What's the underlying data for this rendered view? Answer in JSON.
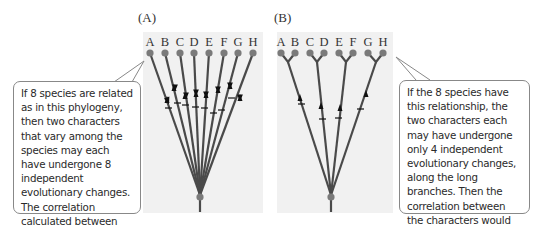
{
  "panels": [
    {
      "id": "A",
      "label": "(A)",
      "tips": [
        "A",
        "B",
        "C",
        "D",
        "E",
        "F",
        "G",
        "H"
      ],
      "topology": "star phylogeny (8 independent branches from root)",
      "independent_changes": 8,
      "callout": "If 8 species are related as in this phylogeny, then two characters that vary among the species may each have undergone 8 independent evolutionary changes. The correlation calculated between those characters will be based on 8 data points."
    },
    {
      "id": "B",
      "label": "(B)",
      "tips": [
        "A",
        "B",
        "C",
        "D",
        "E",
        "F",
        "G",
        "H"
      ],
      "topology": "4 long branches each splitting into sister pairs (A,B) (C,D) (E,F) (G,H)",
      "independent_changes": 4,
      "callout": "If the 8 species have this relationship, the two characters each may have undergone only 4 independent evolutionary changes, along the long branches. Then the correlation between the characters would be based on only 4 data points."
    }
  ],
  "colors": {
    "branch": "#4a4a4a",
    "node": "#7a7a7a",
    "panel_bg": "#f1f1f1",
    "callout_border": "#888888"
  }
}
